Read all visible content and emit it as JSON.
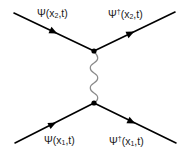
{
  "diagram": {
    "type": "feynman",
    "colors": {
      "fermion": "#000000",
      "photon": "#8a8a8a",
      "vertex": "#000000"
    },
    "labels": {
      "top_left": {
        "field": "Ψ",
        "dagger": "",
        "x": "x",
        "index": "2",
        "rest": ",t)"
      },
      "top_right": {
        "field": "Ψ",
        "dagger": "†",
        "x": "x",
        "index": "2",
        "rest": ",t)"
      },
      "bottom_left": {
        "field": "Ψ",
        "dagger": "",
        "x": "x",
        "index": "1",
        "rest": ",t)"
      },
      "bottom_right": {
        "field": "Ψ",
        "dagger": "†",
        "x": "x",
        "index": "1",
        "rest": ",t)"
      }
    },
    "edges": [
      {
        "name": "incoming-fermion-top",
        "from": "external-top-left",
        "to": "vertex-top",
        "arrow": "forward"
      },
      {
        "name": "outgoing-fermion-top",
        "from": "vertex-top",
        "to": "external-top-right",
        "arrow": "forward"
      },
      {
        "name": "incoming-fermion-bottom",
        "from": "external-bottom-left",
        "to": "vertex-bottom",
        "arrow": "forward"
      },
      {
        "name": "outgoing-fermion-bottom",
        "from": "vertex-bottom",
        "to": "external-bottom-right",
        "arrow": "forward"
      },
      {
        "name": "photon-propagator",
        "from": "vertex-top",
        "to": "vertex-bottom",
        "style": "wavy"
      }
    ]
  }
}
